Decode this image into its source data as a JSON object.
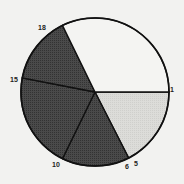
{
  "chart_data": {
    "type": "pie",
    "title": "",
    "center": [
      95,
      92
    ],
    "radius": 74,
    "boundary_labels": [
      "1",
      "5",
      "6",
      "10",
      "15",
      "18"
    ],
    "slices": [
      {
        "from_label": "1",
        "to_label": "5",
        "start_deg": 0,
        "end_deg": 63,
        "fill": "#d9d9d6",
        "pattern": "light"
      },
      {
        "from_label": "6",
        "to_label": "10",
        "start_deg": 63,
        "end_deg": 116,
        "fill": "#4a4a4a",
        "pattern": "dark"
      },
      {
        "from_label": "10",
        "to_label": "15",
        "start_deg": 116,
        "end_deg": 191,
        "fill": "#4a4a4a",
        "pattern": "dark"
      },
      {
        "from_label": "15",
        "to_label": "18",
        "start_deg": 191,
        "end_deg": 244,
        "fill": "#4a4a4a",
        "pattern": "dark"
      },
      {
        "from_label": "18",
        "to_label": "1",
        "start_deg": 244,
        "end_deg": 360,
        "fill": "#f4f4f2",
        "pattern": "white"
      }
    ],
    "labels": [
      {
        "text": "1",
        "x": 170,
        "y": 86
      },
      {
        "text": "5",
        "x": 134,
        "y": 160
      },
      {
        "text": "6",
        "x": 125,
        "y": 163
      },
      {
        "text": "10",
        "x": 52,
        "y": 161
      },
      {
        "text": "15",
        "x": 10,
        "y": 76
      },
      {
        "text": "18",
        "x": 38,
        "y": 24
      }
    ]
  }
}
